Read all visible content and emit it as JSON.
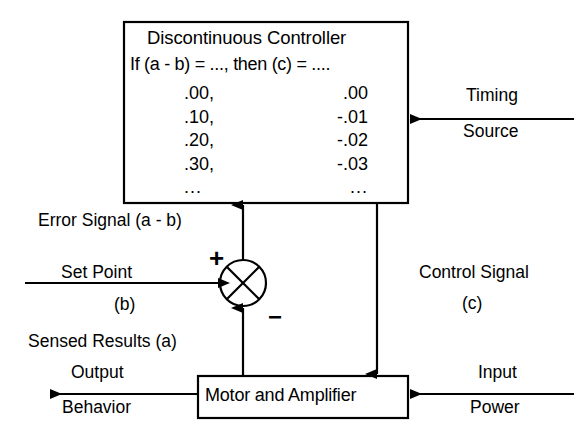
{
  "diagram": {
    "controller": {
      "title": "Discontinuous Controller",
      "rule": "If (a - b) = ..., then (c) = ....",
      "table": {
        "rows": [
          {
            "input": ".00,",
            "output": ".00"
          },
          {
            "input": ".10,",
            "output": "-.01"
          },
          {
            "input": ".20,",
            "output": "-.02"
          },
          {
            "input": ".30,",
            "output": "-.03"
          },
          {
            "input": "...",
            "output": "..."
          }
        ]
      }
    },
    "plant": {
      "label": "Motor and Amplifier"
    },
    "summing_junction": {
      "plus_sign": "+",
      "minus_sign": "−"
    },
    "signals": {
      "timing_line1": "Timing",
      "timing_line2": "Source",
      "error": "Error Signal (a - b)",
      "set_point": "Set Point",
      "set_point_var": "(b)",
      "sensed_results": "Sensed Results (a)",
      "control_line1": "Control Signal",
      "control_var": "(c)",
      "output": "Output",
      "behavior": "Behavior",
      "input": "Input",
      "power": "Power"
    },
    "colors": {
      "line": "#000000",
      "background": "#ffffff",
      "text": "#000000"
    }
  }
}
